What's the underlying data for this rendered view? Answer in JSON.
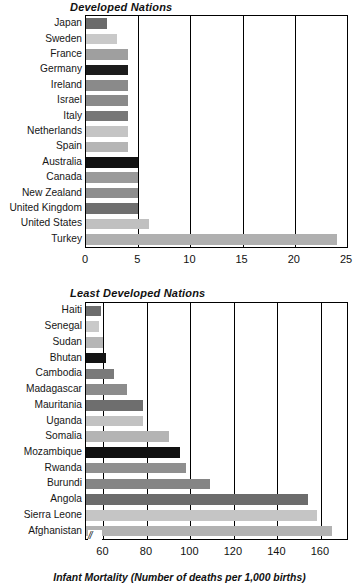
{
  "figure": {
    "axis_caption": "Infant Mortality (Number of deaths per 1,000 births)"
  },
  "panels": [
    {
      "id": "top",
      "title": "Developed Nations"
    },
    {
      "id": "bottom",
      "title": "Least Developed Nations"
    }
  ],
  "chart_data": [
    {
      "type": "bar",
      "orientation": "horizontal",
      "title": "Developed Nations",
      "xlabel": "Infant Mortality (Number of deaths per 1,000 births)",
      "ylabel": "",
      "xlim": [
        0,
        25
      ],
      "xticks": [
        0,
        5,
        10,
        15,
        20,
        25
      ],
      "grid": true,
      "grid_axis": "x",
      "legend": "none",
      "axis_break": false,
      "categories": [
        "Japan",
        "Sweden",
        "France",
        "Germany",
        "Ireland",
        "Israel",
        "Italy",
        "Netherlands",
        "Spain",
        "Australia",
        "Canada",
        "New Zealand",
        "United Kingdom",
        "United States",
        "Turkey"
      ],
      "values": [
        2,
        3,
        4,
        4,
        4,
        4,
        4,
        4,
        4,
        5,
        5,
        5,
        5,
        6,
        24
      ],
      "bar_colors": [
        "#6b6b6b",
        "#c9c9c9",
        "#9f9f9f",
        "#1c1c1c",
        "#8a8a8a",
        "#8a8a8a",
        "#777777",
        "#c4c4c4",
        "#b5b5b5",
        "#121212",
        "#9a9a9a",
        "#8e8e8e",
        "#6f6f6f",
        "#c0c0c0",
        "#b0b0b0"
      ]
    },
    {
      "type": "bar",
      "orientation": "horizontal",
      "title": "Least Developed Nations",
      "xlabel": "Infant Mortality (Number of deaths per 1,000 births)",
      "ylabel": "",
      "xlim": [
        52,
        172
      ],
      "xticks": [
        60,
        80,
        100,
        120,
        140,
        160
      ],
      "grid": true,
      "grid_axis": "x",
      "legend": "none",
      "axis_break": true,
      "categories": [
        "Haiti",
        "Senegal",
        "Sudan",
        "Bhutan",
        "Cambodia",
        "Madagascar",
        "Mauritania",
        "Uganda",
        "Somalia",
        "Mozambique",
        "Rwanda",
        "Burundi",
        "Angola",
        "Sierra Leone",
        "Afghanistan"
      ],
      "values": [
        59,
        58,
        60,
        61,
        65,
        71,
        78,
        78,
        90,
        95,
        98,
        109,
        154,
        158,
        165
      ],
      "bar_colors": [
        "#6d6d6d",
        "#c9c9c9",
        "#b6b6b6",
        "#141414",
        "#7a7a7a",
        "#8c8c8c",
        "#6e6e6e",
        "#c2c2c2",
        "#b4b4b4",
        "#111111",
        "#8f8f8f",
        "#858585",
        "#6c6c6c",
        "#c5c5c5",
        "#b2b2b2"
      ]
    }
  ]
}
